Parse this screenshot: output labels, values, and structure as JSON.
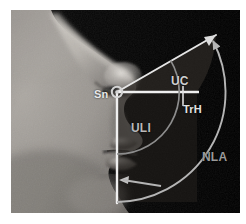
{
  "figure": {
    "kind": "annotated-photograph",
    "background_color": "#ffffff",
    "photo": {
      "background_color": "#000000",
      "skin_tone_light": "#b4b0ab",
      "skin_tone_mid": "#8e8a86",
      "skin_tone_dark": "#4a4744",
      "border_color": "#b0b0b0"
    },
    "overlay": {
      "line_color": "#e6e6e6",
      "arc_color": "#9e9e9e",
      "wedge_fill": "#2b2723",
      "vertex_marker_color": "#cfcfcf"
    }
  },
  "labels": {
    "sn": "Sn",
    "uc": "UC",
    "trh": "TrH",
    "uli": "ULI",
    "nla": "NLA"
  },
  "annotations": [
    {
      "id": "sn",
      "text": "Sn",
      "meaning": "subnasale landmark (angle vertex)"
    },
    {
      "id": "uc",
      "text": "UC",
      "meaning": "upper columella angle segment"
    },
    {
      "id": "trh",
      "text": "TrH",
      "meaning": "true horizontal reference line"
    },
    {
      "id": "uli",
      "text": "ULI",
      "meaning": "upper lip inclination segment"
    },
    {
      "id": "nla",
      "text": "NLA",
      "meaning": "nasolabial angle (total arc)"
    }
  ],
  "geometry": {
    "vertex": {
      "x": 106,
      "y": 82
    },
    "columella_ray": {
      "to_x": 205,
      "to_y": 25,
      "arrowhead": true
    },
    "horizontal_ray": {
      "to_x": 186,
      "to_y": 82,
      "tick_at_x": 172
    },
    "upper_lip_ray": {
      "to_x": 106,
      "to_y": 192,
      "arrowhead": false
    },
    "inner_arc_radius": 62,
    "outer_arc_radius": 112,
    "nla_arrow_head": "pointing-left-at-lip-ray"
  }
}
